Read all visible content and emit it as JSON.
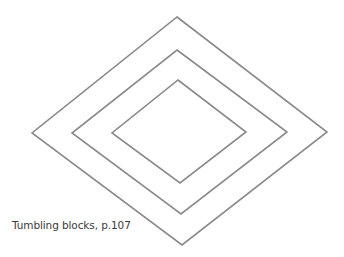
{
  "figure": {
    "stroke_color": "#8a8a8a",
    "stroke_width": 1.6,
    "diamonds": [
      {
        "name": "outer",
        "points": "177,17 327,132 182,245 32,133"
      },
      {
        "name": "middle",
        "points": "177,50 287,132 181,214 72,133"
      },
      {
        "name": "inner",
        "points": "178,80 246,132 180,183 112,133"
      }
    ]
  },
  "caption": {
    "text": "Tumbling blocks, p.107"
  }
}
